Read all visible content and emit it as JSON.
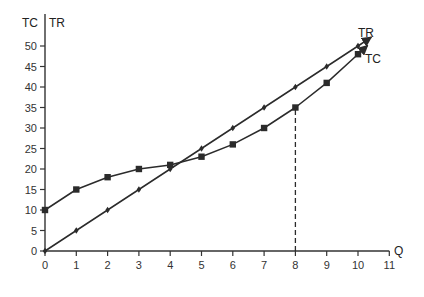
{
  "chart_data": {
    "type": "line",
    "title": "",
    "xlabel": "Q",
    "ylabel": "TC | TR",
    "y_axis_title_left": "TC",
    "y_axis_title_right": "TR",
    "x": [
      0,
      1,
      2,
      3,
      4,
      5,
      6,
      7,
      8,
      9,
      10
    ],
    "series": [
      {
        "name": "TR",
        "marker": "diamond",
        "values": [
          0,
          5,
          10,
          15,
          20,
          25,
          30,
          35,
          40,
          45,
          50
        ],
        "arrow_end": true
      },
      {
        "name": "TC",
        "marker": "square",
        "values": [
          10,
          15,
          18,
          20,
          21,
          23,
          26,
          30,
          35,
          41,
          48
        ],
        "arrow_end": true
      }
    ],
    "x_ticks": [
      "0",
      "1",
      "2",
      "3",
      "4",
      "5",
      "6",
      "7",
      "8",
      "9",
      "10",
      "11"
    ],
    "y_ticks": [
      "0",
      "5",
      "10",
      "15",
      "20",
      "25",
      "30",
      "35",
      "40",
      "45",
      "50"
    ],
    "xlim": [
      0,
      11
    ],
    "ylim": [
      0,
      52
    ],
    "grid": false,
    "legend": "inline labels at line ends",
    "annotations": [
      {
        "type": "dashed-vertical-line",
        "x": 8,
        "from_y": 0,
        "to_y": 35
      }
    ],
    "colors": {
      "line": "#2b2b2b",
      "axis": "#333333",
      "text": "#333333"
    }
  }
}
